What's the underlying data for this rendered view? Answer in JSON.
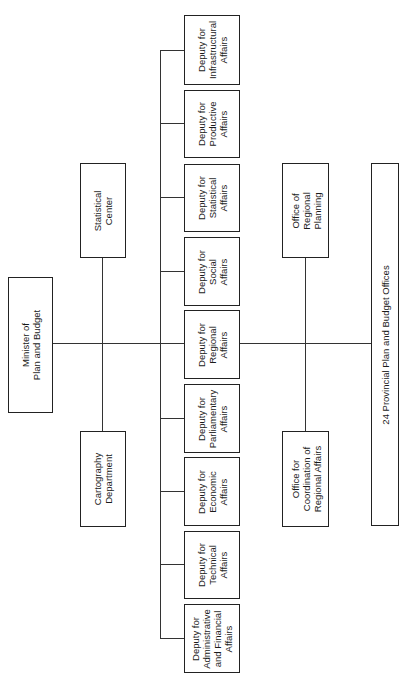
{
  "diagram": {
    "type": "organization-chart",
    "orientation": "rotated-90-ccw",
    "root": {
      "label": "Minister of\nPlan and Budget"
    },
    "staff_units": [
      {
        "label": "Statistical\nCenter"
      },
      {
        "label": "Cartography\nDepartment"
      }
    ],
    "deputies": [
      {
        "label": "Deputy for\nInfrastructural\nAffairs"
      },
      {
        "label": "Deputy for\nProductive\nAffairs"
      },
      {
        "label": "Deputy for\nStatistical\nAffairs"
      },
      {
        "label": "Deputy for\nSocial\nAffairs"
      },
      {
        "label": "Deputy for\nRegional\nAffairs"
      },
      {
        "label": "Deputy for\nParliamentary\nAffairs"
      },
      {
        "label": "Deputy for\nEconomic\nAffairs"
      },
      {
        "label": "Deputy for\nTechnical\nAffairs"
      },
      {
        "label": "Deputy for\nAdministrative\nand Financial\nAffairs"
      }
    ],
    "regional_offices": [
      {
        "label": "Office of\nRegional\nPlanning"
      },
      {
        "label": "Office for\nCoordination of\nRegional Affairs"
      }
    ],
    "provincial": {
      "label": "24 Provincial Plan and Budget Offices"
    }
  }
}
